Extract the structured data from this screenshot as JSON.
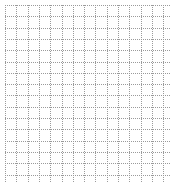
{
  "grid": {
    "background": "#ffffff",
    "line_color": "#9a9a9a",
    "line_style": "dotted",
    "columns": 15,
    "rows": 16,
    "spacing_px": 11.3,
    "origin_x": 5,
    "origin_y": 5
  }
}
